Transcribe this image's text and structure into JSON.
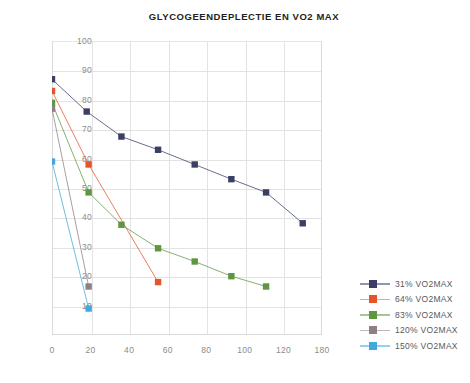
{
  "chart_data": {
    "type": "line",
    "title": "GLYCOGEENDEPLECTIE EN VO2 MAX",
    "xlabel": "",
    "ylabel": "",
    "xlim": [
      0,
      140
    ],
    "ylim": [
      0,
      100
    ],
    "grid": true,
    "legend_position": "right",
    "marker": "square",
    "x_ticks": [
      "0",
      "20",
      "40",
      "60",
      "80",
      "100",
      "120",
      "180"
    ],
    "x_tick_values": [
      0,
      20,
      40,
      60,
      80,
      100,
      120,
      140
    ],
    "y_ticks": [
      "10",
      "20",
      "30",
      "40",
      "50",
      "60",
      "70",
      "80",
      "90",
      "100"
    ],
    "y_tick_values": [
      10,
      20,
      30,
      40,
      50,
      60,
      70,
      80,
      90,
      100
    ],
    "series": [
      {
        "name": "31% VO2MAX",
        "color": "#3b3f66",
        "x": [
          0,
          18,
          36,
          55,
          74,
          93,
          111,
          130
        ],
        "y": [
          87,
          76,
          67.5,
          63,
          58,
          53,
          48.5,
          38
        ]
      },
      {
        "name": "64% VO2MAX",
        "color": "#e2562a",
        "x": [
          0,
          19,
          55
        ],
        "y": [
          83,
          58,
          18
        ]
      },
      {
        "name": "83% VO2MAX",
        "color": "#5f9741",
        "x": [
          0,
          19,
          36,
          55,
          74,
          93,
          111
        ],
        "y": [
          79,
          48.5,
          37.5,
          29.5,
          25,
          20,
          16.5
        ]
      },
      {
        "name": "120% VO2MAX",
        "color": "#8d7f86",
        "x": [
          0,
          19
        ],
        "y": [
          77,
          16.5
        ]
      },
      {
        "name": "150% VO2MAX",
        "color": "#3fa9dd",
        "x": [
          0,
          19
        ],
        "y": [
          59,
          9
        ]
      }
    ]
  },
  "legend": {
    "entries": [
      {
        "label": "31% VO2MAX",
        "color": "#3b3f66"
      },
      {
        "label": "64% VO2MAX",
        "color": "#e2562a"
      },
      {
        "label": "83% VO2MAX",
        "color": "#5f9741"
      },
      {
        "label": "120% VO2MAX",
        "color": "#8d7f86"
      },
      {
        "label": "150% VO2MAX",
        "color": "#3fa9dd"
      }
    ]
  }
}
